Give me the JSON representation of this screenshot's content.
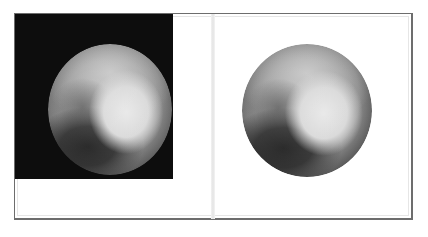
{
  "comparison": {
    "left_panel": {
      "label": "Original image with dark background",
      "background_color": "#0d0d0d",
      "subject": "pluto"
    },
    "right_panel": {
      "label": "Background removed",
      "background_color": "#ffffff",
      "subject": "pluto"
    }
  },
  "colors": {
    "frame_border": "#6d6d6d",
    "divider": "#e4e4e4"
  }
}
